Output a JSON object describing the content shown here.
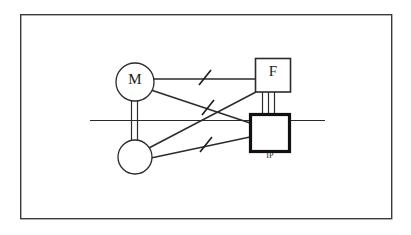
{
  "figure": {
    "type": "schematic-diagram",
    "title": "",
    "frame": {
      "name": "outer-border",
      "x": 20,
      "y": 14,
      "width": 372,
      "height": 205,
      "stroke": "#3a3a3a",
      "stroke_width": 1.4,
      "fill": "#ffffff"
    },
    "nodes": [
      {
        "id": "motor",
        "shape": "circle",
        "label": "M",
        "cx": 135,
        "cy": 82,
        "r": 19,
        "stroke": "#2b2b2b",
        "stroke_width": 1.3,
        "fill": "#ffffff"
      },
      {
        "id": "lower-rotor",
        "shape": "circle",
        "label": "",
        "cx": 135,
        "cy": 157,
        "r": 17,
        "stroke": "#2b2b2b",
        "stroke_width": 1.3,
        "fill": "#ffffff"
      },
      {
        "id": "filter",
        "shape": "rect",
        "label": "F",
        "x": 255,
        "y": 58,
        "width": 35,
        "height": 34,
        "stroke": "#2b2b2b",
        "stroke_width": 1.6,
        "fill": "#ffffff"
      },
      {
        "id": "ip-unit",
        "shape": "rect",
        "label": "IP",
        "label_position": "below",
        "x": 249,
        "y": 113,
        "width": 41,
        "height": 39,
        "stroke": "#111111",
        "stroke_width": 3.2,
        "fill": "#ffffff"
      }
    ],
    "edges": [
      {
        "id": "motor-to-filter",
        "from": "motor",
        "to": "filter",
        "style": "single-line",
        "tick": true,
        "x1": 154,
        "y1": 79,
        "x2": 255,
        "y2": 79
      },
      {
        "id": "motor-to-ip",
        "from": "motor",
        "to": "ip-unit",
        "style": "single-line",
        "tick": true,
        "x1": 152,
        "y1": 91,
        "x2": 249,
        "y2": 122
      },
      {
        "id": "rotor-to-filter",
        "from": "lower-rotor",
        "to": "filter",
        "style": "single-line",
        "tick": false,
        "x1": 148,
        "y1": 149,
        "x2": 255,
        "y2": 92
      },
      {
        "id": "rotor-to-ip",
        "from": "lower-rotor",
        "to": "ip-unit",
        "style": "single-line",
        "tick": true,
        "x1": 152,
        "y1": 158,
        "x2": 249,
        "y2": 136
      },
      {
        "id": "motor-rotor-shaft",
        "from": "motor",
        "to": "lower-rotor",
        "style": "double-line",
        "tick": false,
        "x1": 135,
        "y1": 101,
        "x2": 135,
        "y2": 140
      },
      {
        "id": "filter-to-ip-bus",
        "from": "filter",
        "to": "ip-unit",
        "style": "triple-line",
        "tick": false,
        "x1": 268,
        "y1": 92,
        "x2": 268,
        "y2": 113
      }
    ],
    "axis_line": {
      "name": "horizontal-axis",
      "x1": 90,
      "y1": 120,
      "x2": 325,
      "y2": 120,
      "stroke": "#2b2b2b",
      "stroke_width": 1.2
    },
    "tick_marks": [
      {
        "id": "tick-motor-filter",
        "cx": 205,
        "cy": 79,
        "angle_deg": -52,
        "length": 16
      },
      {
        "id": "tick-motor-ip",
        "cx": 208,
        "cy": 109,
        "angle_deg": -52,
        "length": 16
      },
      {
        "id": "tick-rotor-ip",
        "cx": 206,
        "cy": 146,
        "angle_deg": -52,
        "length": 16
      }
    ],
    "labels": {
      "motor": "M",
      "filter": "F",
      "ip_unit": "IP"
    },
    "colors": {
      "stroke_dark": "#111111",
      "stroke_medium": "#2b2b2b",
      "stroke_frame": "#3a3a3a",
      "background": "#ffffff"
    }
  }
}
